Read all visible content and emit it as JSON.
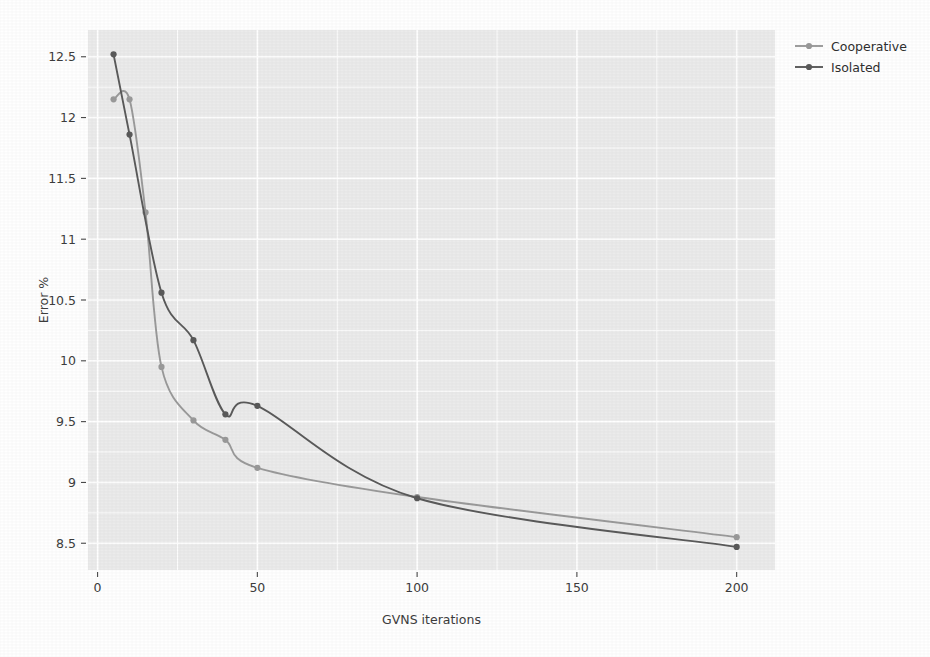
{
  "chart_data": {
    "type": "line",
    "title": "",
    "xlabel": "GVNS iterations",
    "ylabel": "Error %",
    "xlim": [
      -3,
      212
    ],
    "ylim": [
      8.28,
      12.72
    ],
    "grid": true,
    "legend_position": "right",
    "x_ticks": [
      0,
      50,
      100,
      150,
      200
    ],
    "x_tick_labels": [
      "0",
      "50",
      "100",
      "150",
      "200"
    ],
    "y_ticks": [
      8.5,
      9,
      9.5,
      10,
      10.5,
      11,
      11.5,
      12,
      12.5
    ],
    "y_tick_labels": [
      "8.5",
      "9",
      "9.5",
      "10",
      "10.5",
      "11",
      "11.5",
      "12",
      "12.5"
    ],
    "series": [
      {
        "name": "Cooperative",
        "color": "#9a9a9a",
        "marker": "circle",
        "x": [
          5,
          10,
          15,
          20,
          30,
          40,
          50,
          100,
          200
        ],
        "values": [
          12.15,
          12.15,
          11.22,
          9.95,
          9.51,
          9.35,
          9.12,
          8.88,
          8.55
        ]
      },
      {
        "name": "Isolated",
        "color": "#5a5a5a",
        "marker": "circle",
        "x": [
          5,
          10,
          20,
          30,
          40,
          50,
          100,
          200
        ],
        "values": [
          12.52,
          11.86,
          10.56,
          10.17,
          9.56,
          9.63,
          8.87,
          8.47
        ]
      }
    ]
  },
  "legend": {
    "entries": [
      {
        "label": "Cooperative",
        "color": "#9a9a9a"
      },
      {
        "label": "Isolated",
        "color": "#5a5a5a"
      }
    ]
  },
  "axes": {
    "x_title": "GVNS iterations",
    "y_title": "Error %"
  },
  "colors": {
    "panel_background": "#ebebeb",
    "gridline": "#ffffff",
    "page_background": "#ffffff",
    "text": "#3d3d3d",
    "cooperative": "#9a9a9a",
    "isolated": "#5a5a5a"
  }
}
